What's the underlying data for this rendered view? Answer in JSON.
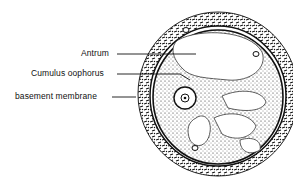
{
  "diagram": {
    "labels": [
      {
        "id": "antrum",
        "text": "Antrum"
      },
      {
        "id": "cumulus",
        "text": "Cumulus oophorus"
      },
      {
        "id": "basement",
        "text": "basement membrane"
      }
    ],
    "colors": {
      "ink": "#111111",
      "background": "#ffffff"
    }
  }
}
